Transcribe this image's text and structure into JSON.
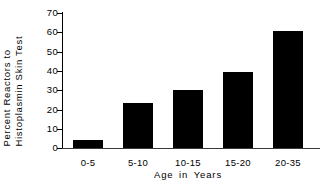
{
  "chart_data": {
    "type": "bar",
    "title": "",
    "xlabel": "Age  in  Years",
    "ylabel": "Percent Reactors to Histoplasmin Skin Test",
    "ylabel_lines": [
      "Percent  Reactors  to",
      "Histoplasmin  Skin  Test"
    ],
    "categories": [
      "0-5",
      "5-10",
      "10-15",
      "15-20",
      "20-35"
    ],
    "values": [
      4,
      23,
      30,
      39,
      60
    ],
    "ylim": [
      0,
      70
    ],
    "yticks": [
      0,
      10,
      20,
      30,
      40,
      50,
      60,
      70
    ],
    "ytick_labels": [
      "0",
      "10",
      "20",
      "30",
      "40",
      "50",
      "60",
      "70"
    ],
    "grid": false,
    "legend": null,
    "bar_color": "#000000",
    "axis_color": "#000000",
    "background_color": "#ffffff"
  }
}
